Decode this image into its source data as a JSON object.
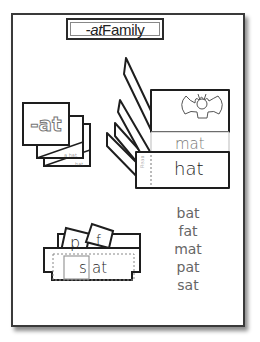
{
  "title": {
    "prefix": "-at",
    "suffix": " Family"
  },
  "word_cards": {
    "front_label": "-at",
    "back_card_texts": [
      "a hat.",
      "hat."
    ]
  },
  "flip_book": {
    "picture": "bat-illustration",
    "middle_word": "mat",
    "bottom_word": "hat",
    "side_label": "Read"
  },
  "slider": {
    "letter_cards": [
      "p",
      "f"
    ],
    "window_letter": "s",
    "rime": "at"
  },
  "word_list": [
    "bat",
    "fat",
    "mat",
    "pat",
    "sat"
  ],
  "colors": {
    "outline": "#222222",
    "text": "#555555",
    "page_border": "#3a3a3a"
  }
}
